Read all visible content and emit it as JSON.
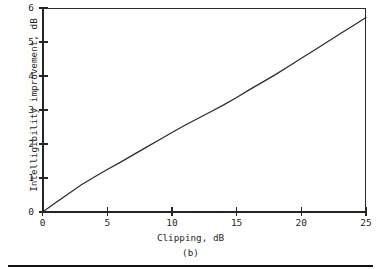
{
  "figure": {
    "caption": "(b)"
  },
  "chart_data": {
    "type": "line",
    "title": "",
    "subtitle": "",
    "xlabel": "Clipping, dB",
    "ylabel": "Intelligibility improvement, dB",
    "xlim": [
      0,
      25
    ],
    "ylim": [
      0,
      6
    ],
    "xticks": [
      0,
      5,
      10,
      15,
      20,
      25
    ],
    "xtick_labels": [
      "0",
      "5",
      "10",
      "15",
      "20",
      "25"
    ],
    "yticks": [
      0,
      1,
      2,
      3,
      4,
      5,
      6
    ],
    "ytick_labels": [
      "0",
      "1",
      "2",
      "3",
      "4",
      "5",
      "6"
    ],
    "grid": false,
    "legend": null,
    "legend_position": "none",
    "annotations": [
      "(b)"
    ],
    "series": [
      {
        "name": "Intelligibility improvement vs clipping",
        "color": "#2b2b2b",
        "x": [
          0,
          1,
          2,
          3,
          4,
          5,
          6,
          7,
          8,
          9,
          10,
          11,
          12,
          13,
          14,
          15,
          16,
          17,
          18,
          19,
          20,
          21,
          22,
          23,
          24,
          25
        ],
        "y": [
          0.0,
          0.27,
          0.54,
          0.8,
          1.03,
          1.25,
          1.46,
          1.68,
          1.9,
          2.12,
          2.34,
          2.55,
          2.75,
          2.95,
          3.15,
          3.37,
          3.6,
          3.82,
          4.04,
          4.28,
          4.52,
          4.76,
          5.0,
          5.24,
          5.48,
          5.72
        ]
      }
    ]
  },
  "axes": {
    "y_label": "Intelligibility improvement, dB",
    "x_label": "Clipping, dB"
  }
}
